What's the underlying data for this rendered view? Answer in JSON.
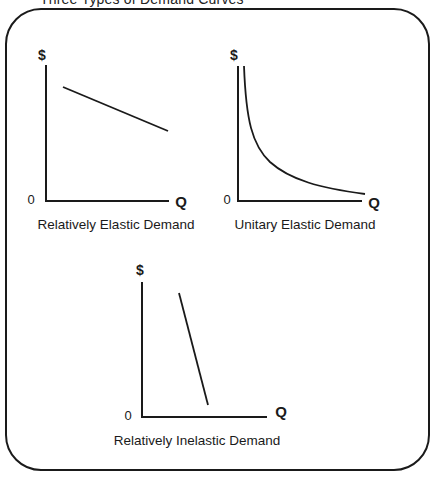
{
  "page": {
    "title": "Three Types of Demand Curves",
    "frame_color": "#1a1a1a"
  },
  "charts": [
    {
      "id": "relatively-elastic",
      "caption": "Relatively Elastic Demand",
      "y_label": "$",
      "x_label": "Q",
      "origin_label": "0",
      "curve_type": "line",
      "description": "Shallow downward-sloping straight demand line"
    },
    {
      "id": "unitary-elastic",
      "caption": "Unitary Elastic Demand",
      "y_label": "$",
      "x_label": "Q",
      "origin_label": "0",
      "curve_type": "hyperbola",
      "description": "Rectangular hyperbola demand curve (P×Q constant)"
    },
    {
      "id": "relatively-inelastic",
      "caption": "Relatively Inelastic Demand",
      "y_label": "$",
      "x_label": "Q",
      "origin_label": "0",
      "curve_type": "line",
      "description": "Steep downward-sloping straight demand line"
    }
  ]
}
